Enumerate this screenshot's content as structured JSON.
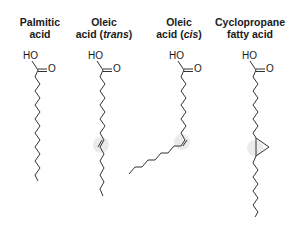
{
  "molecules": [
    {
      "name_line1": "Palmitic",
      "name_line2": "acid",
      "name_italic": "",
      "hydroxyl_label": "HO",
      "carbonyl_label": "O"
    },
    {
      "name_line1": "Oleic",
      "name_line2": "acid (",
      "name_italic": "trans",
      "name_suffix": ")",
      "hydroxyl_label": "HO",
      "carbonyl_label": "O"
    },
    {
      "name_line1": "Oleic",
      "name_line2": "acid (",
      "name_italic": "cis",
      "name_suffix": ")",
      "hydroxyl_label": "HO",
      "carbonyl_label": "O"
    },
    {
      "name_line1": "Cyclopropane",
      "name_line2": "fatty acid",
      "name_italic": "",
      "hydroxyl_label": "HO",
      "carbonyl_label": "O"
    }
  ],
  "colors": {
    "bond": "#333333",
    "highlight": "#e9e9e9",
    "text": "#1a1a1a"
  }
}
